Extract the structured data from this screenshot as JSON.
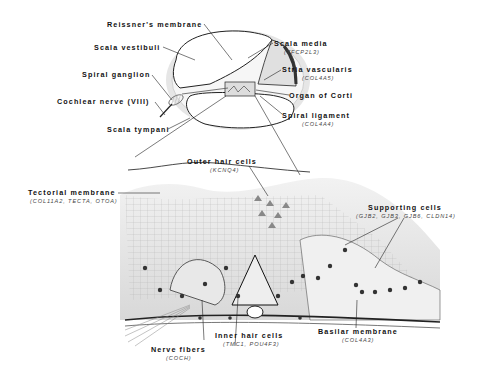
{
  "diagram": {
    "upper_labels": [
      {
        "id": "reissners-membrane",
        "name": "Reissner's membrane",
        "gene": ""
      },
      {
        "id": "scala-vestibuli",
        "name": "Scala vestibuli",
        "gene": ""
      },
      {
        "id": "spiral-ganglion",
        "name": "Spiral ganglion",
        "gene": ""
      },
      {
        "id": "cochlear-nerve",
        "name": "Cochlear nerve (VIII)",
        "gene": ""
      },
      {
        "id": "scala-tympani",
        "name": "Scala tympani",
        "gene": ""
      },
      {
        "id": "scala-media",
        "name": "Scala media",
        "gene": "(TFCP2L3)"
      },
      {
        "id": "stria-vascularis",
        "name": "Stria vascularis",
        "gene": "(COL4A5)"
      },
      {
        "id": "organ-of-corti",
        "name": "Organ of Corti",
        "gene": ""
      },
      {
        "id": "spiral-ligament",
        "name": "Spiral ligament",
        "gene": "(COL4A4)"
      }
    ],
    "lower_labels": [
      {
        "id": "outer-hair-cells",
        "name": "Outer hair cells",
        "gene": "(KCNQ4)"
      },
      {
        "id": "tectorial-membrane",
        "name": "Tectorial membrane",
        "gene": "(COL11A2, TECTA, OTOA)"
      },
      {
        "id": "supporting-cells",
        "name": "Supporting cells",
        "gene": "(GJB2, GJB3, GJB6, CLDN14)"
      },
      {
        "id": "inner-hair-cells",
        "name": "Inner hair cells",
        "gene": "(TMC1, POU4F3)"
      },
      {
        "id": "basilar-membrane",
        "name": "Basilar membrane",
        "gene": "(COL4A3)"
      },
      {
        "id": "nerve-fibers",
        "name": "Nerve fibers",
        "gene": "(COCH)"
      }
    ]
  }
}
